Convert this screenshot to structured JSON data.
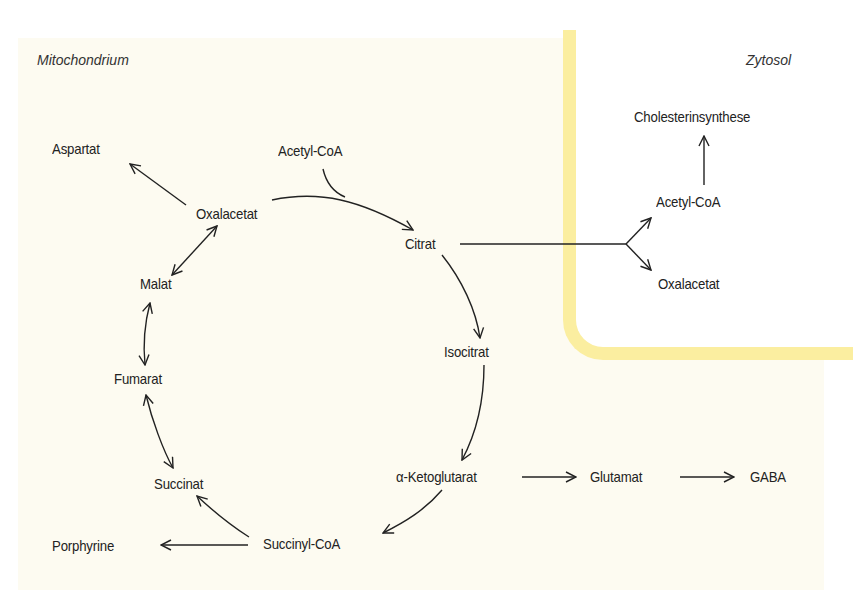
{
  "compartments": {
    "mitochondrium": "Mitochondrium",
    "zytosol": "Zytosol"
  },
  "metabolites": {
    "aspartat": "Aspartat",
    "acetyl_coa_mito": "Acetyl-CoA",
    "oxalacetat_mito": "Oxalacetat",
    "citrat": "Citrat",
    "malat": "Malat",
    "isocitrat": "Isocitrat",
    "fumarat": "Fumarat",
    "alpha_ketoglutarat": "α-Ketoglutarat",
    "glutamat": "Glutamat",
    "gaba": "GABA",
    "succinat": "Succinat",
    "succinyl_coa": "Succinyl-CoA",
    "porphyrine": "Porphyrine",
    "cholesterinsynthese": "Cholesterinsynthese",
    "acetyl_coa_cyto": "Acetyl-CoA",
    "oxalacetat_cyto": "Oxalacetat"
  },
  "colors": {
    "mitochondrium_bg": "#fdfbf1",
    "membrane": "#fbeea0",
    "zytosol_bg": "#ffffff",
    "ink": "#222222"
  },
  "edges": [
    {
      "from": "Oxalacetat",
      "to": "Aspartat",
      "type": "forward"
    },
    {
      "from": "Oxalacetat",
      "to": "Citrat",
      "type": "forward",
      "cofactor_in": "Acetyl-CoA"
    },
    {
      "from": "Citrat",
      "to": "Isocitrat",
      "type": "forward"
    },
    {
      "from": "Isocitrat",
      "to": "α-Ketoglutarat",
      "type": "forward"
    },
    {
      "from": "α-Ketoglutarat",
      "to": "Succinyl-CoA",
      "type": "forward"
    },
    {
      "from": "α-Ketoglutarat",
      "to": "Glutamat",
      "type": "forward"
    },
    {
      "from": "Glutamat",
      "to": "GABA",
      "type": "forward"
    },
    {
      "from": "Succinyl-CoA",
      "to": "Succinat",
      "type": "forward"
    },
    {
      "from": "Succinyl-CoA",
      "to": "Porphyrine",
      "type": "forward"
    },
    {
      "from": "Succinat",
      "to": "Fumarat",
      "type": "reversible"
    },
    {
      "from": "Fumarat",
      "to": "Malat",
      "type": "reversible"
    },
    {
      "from": "Malat",
      "to": "Oxalacetat",
      "type": "reversible"
    },
    {
      "from": "Citrat",
      "to": "Acetyl-CoA (Zytosol)",
      "type": "forward"
    },
    {
      "from": "Citrat",
      "to": "Oxalacetat (Zytosol)",
      "type": "forward"
    },
    {
      "from": "Acetyl-CoA (Zytosol)",
      "to": "Cholesterinsynthese",
      "type": "forward"
    }
  ]
}
